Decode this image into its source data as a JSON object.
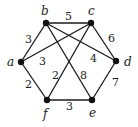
{
  "graph": {
    "vertices": [
      {
        "id": "a",
        "label": "a",
        "x": 21,
        "y": 62,
        "lx": 7,
        "ly": 66
      },
      {
        "id": "b",
        "label": "b",
        "x": 46,
        "y": 23,
        "lx": 41,
        "ly": 15
      },
      {
        "id": "c",
        "label": "c",
        "x": 91,
        "y": 23,
        "lx": 88,
        "ly": 15
      },
      {
        "id": "d",
        "label": "d",
        "x": 116,
        "y": 61,
        "lx": 124,
        "ly": 66
      },
      {
        "id": "e",
        "label": "e",
        "x": 92,
        "y": 100,
        "lx": 89,
        "ly": 117
      },
      {
        "id": "f",
        "label": "f",
        "x": 47,
        "y": 100,
        "lx": 43,
        "ly": 118
      }
    ],
    "edges": [
      {
        "from": "a",
        "to": "b",
        "weight": "3",
        "lx": 25,
        "ly": 43
      },
      {
        "from": "b",
        "to": "c",
        "weight": "5",
        "lx": 65,
        "ly": 20
      },
      {
        "from": "c",
        "to": "d",
        "weight": "6",
        "lx": 108,
        "ly": 42
      },
      {
        "from": "d",
        "to": "e",
        "weight": "7",
        "lx": 112,
        "ly": 86
      },
      {
        "from": "e",
        "to": "f",
        "weight": "3",
        "lx": 66,
        "ly": 110
      },
      {
        "from": "f",
        "to": "a",
        "weight": "2",
        "lx": 25,
        "ly": 88
      },
      {
        "from": "a",
        "to": "c",
        "weight": "3",
        "lx": 39,
        "ly": 65
      },
      {
        "from": "b",
        "to": "d",
        "weight": "4",
        "lx": 90,
        "ly": 62
      },
      {
        "from": "c",
        "to": "f",
        "weight": "2",
        "lx": 52,
        "ly": 79
      },
      {
        "from": "b",
        "to": "e",
        "weight": "8",
        "lx": 80,
        "ly": 79
      }
    ]
  }
}
